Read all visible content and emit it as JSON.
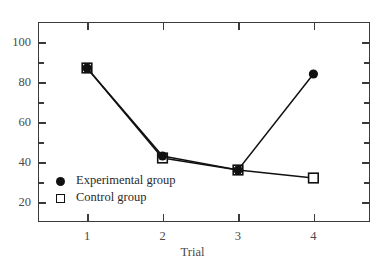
{
  "chart_data": {
    "type": "line",
    "title": "",
    "xlabel": "Trial",
    "ylabel": "",
    "categories": [
      "1",
      "2",
      "3",
      "4"
    ],
    "x": [
      1,
      2,
      3,
      4
    ],
    "series": [
      {
        "name": "Experimental group",
        "marker": "filled-circle",
        "values": [
          87,
          43,
          36,
          84
        ]
      },
      {
        "name": "Control group",
        "marker": "open-square",
        "values": [
          87,
          42,
          36,
          32
        ]
      }
    ],
    "xlim": [
      0.35,
      4.75
    ],
    "ylim": [
      10,
      110
    ],
    "ytick_labels": [
      "20",
      "40",
      "60",
      "80",
      "100"
    ],
    "ytick_values": [
      20,
      40,
      60,
      80,
      100
    ],
    "yminor_values": [
      30,
      50,
      70,
      90,
      110
    ],
    "xtick_labels": [
      "1",
      "2",
      "3",
      "4"
    ],
    "grid": false,
    "legend_position": "inside-lower-left",
    "frame": "box-all-sides-inward-ticks",
    "colors": {
      "line": "#111111",
      "marker": "#111111",
      "axis": "#3a3a3a",
      "text": "#4a4a4a",
      "background": "#ffffff"
    }
  },
  "legend": {
    "items": [
      {
        "label": "Experimental group",
        "marker": "filled-circle"
      },
      {
        "label": "Control group",
        "marker": "open-square"
      }
    ]
  },
  "axes": {
    "x_title": "Trial"
  }
}
